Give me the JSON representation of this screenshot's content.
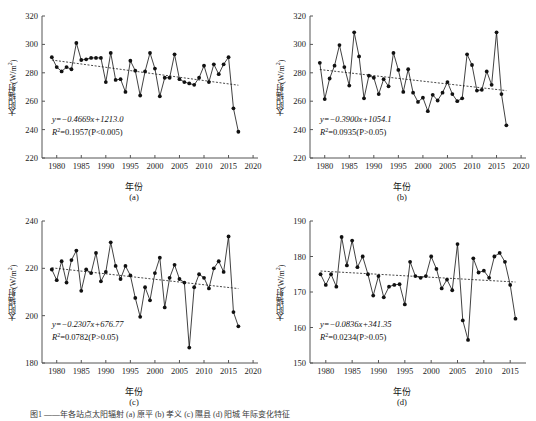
{
  "figure": {
    "axis_y_label": "太阳辐射(W/m",
    "axis_y_label_sup": "2",
    "axis_y_label_tail": ")",
    "axis_x_label": "年份",
    "caption_partial": "图1  ——年各站点太阳辐射 (a) 原平 (b) 孝义 (c) 隰县 (d) 阳城 年际变化特征"
  },
  "panels": [
    {
      "key": "a",
      "label": "(a)",
      "equation": "y=−0.4669x+1213.0",
      "r2_prefix": "R",
      "r2_sup": "2",
      "r2_text": "=0.1957(P<0.005)"
    },
    {
      "key": "b",
      "label": "(b)",
      "equation": "y=−0.3900x+1054.1",
      "r2_prefix": "R",
      "r2_sup": "2",
      "r2_text": "=0.0935(P>0.05)"
    },
    {
      "key": "c",
      "label": "(c)",
      "equation": "y=−0.2307x+676.77",
      "r2_prefix": "R",
      "r2_sup": "2",
      "r2_text": "=0.0782(P>0.05)"
    },
    {
      "key": "d",
      "label": "(d)",
      "equation": "y=−0.0836x+341.35",
      "r2_prefix": "R",
      "r2_sup": "2",
      "r2_text": "=0.0234(P>0.05)"
    }
  ],
  "chart_data": [
    {
      "panel": "a",
      "type": "line",
      "title": "(a)",
      "xlabel": "年份",
      "ylabel": "太阳辐射(W/m2)",
      "xlim": [
        1977,
        2021
      ],
      "ylim": [
        220,
        320
      ],
      "yticks": [
        220,
        240,
        260,
        280,
        300,
        320
      ],
      "xticks": [
        1980,
        1985,
        1990,
        1995,
        2000,
        2005,
        2010,
        2015,
        2020
      ],
      "grid": false,
      "legend": "none",
      "markers": "filled-circle",
      "trendline": {
        "style": "dotted",
        "slope": -0.4669,
        "intercept": 1213.0,
        "r2": 0.1957,
        "p": "<0.005"
      },
      "x": [
        1979,
        1980,
        1981,
        1982,
        1983,
        1984,
        1985,
        1986,
        1987,
        1988,
        1989,
        1990,
        1991,
        1992,
        1993,
        1994,
        1995,
        1996,
        1997,
        1998,
        1999,
        2000,
        2001,
        2002,
        2003,
        2004,
        2005,
        2006,
        2007,
        2008,
        2009,
        2010,
        2011,
        2012,
        2013,
        2014,
        2015,
        2016,
        2017
      ],
      "y": [
        291.0,
        284.0,
        281.0,
        284.0,
        282.5,
        301.0,
        289.0,
        289.5,
        290.5,
        290.5,
        290.5,
        273.5,
        294.0,
        275.0,
        275.5,
        266.5,
        288.5,
        281.5,
        264.0,
        281.0,
        294.0,
        283.0,
        263.5,
        276.5,
        276.5,
        293.0,
        275.5,
        273.5,
        272.5,
        271.5,
        276.5,
        285.0,
        273.5,
        286.0,
        279.0,
        286.0,
        291.0,
        255.0,
        238.5
      ]
    },
    {
      "panel": "b",
      "type": "line",
      "title": "(b)",
      "xlabel": "年份",
      "ylabel": "太阳辐射(W/m2)",
      "xlim": [
        1977,
        2021
      ],
      "ylim": [
        220,
        320
      ],
      "yticks": [
        220,
        240,
        260,
        280,
        300,
        320
      ],
      "xticks": [
        1980,
        1985,
        1990,
        1995,
        2000,
        2005,
        2010,
        2015,
        2020
      ],
      "grid": false,
      "legend": "none",
      "markers": "filled-circle",
      "trendline": {
        "style": "dotted",
        "slope": -0.39,
        "intercept": 1054.1,
        "r2": 0.0935,
        "p": ">0.05"
      },
      "x": [
        1979,
        1980,
        1981,
        1982,
        1983,
        1984,
        1985,
        1986,
        1987,
        1988,
        1989,
        1990,
        1991,
        1992,
        1993,
        1994,
        1995,
        1996,
        1997,
        1998,
        1999,
        2000,
        2001,
        2002,
        2003,
        2004,
        2005,
        2006,
        2007,
        2008,
        2009,
        2010,
        2011,
        2012,
        2013,
        2014,
        2015,
        2016,
        2017
      ],
      "y": [
        287.0,
        261.5,
        276.0,
        285.0,
        299.5,
        284.0,
        271.0,
        308.5,
        291.5,
        262.0,
        278.0,
        276.5,
        265.0,
        275.5,
        270.5,
        294.0,
        282.0,
        266.5,
        282.5,
        266.0,
        259.5,
        262.5,
        253.0,
        264.5,
        260.5,
        266.0,
        273.5,
        265.0,
        260.0,
        262.0,
        293.0,
        285.5,
        267.5,
        268.0,
        281.0,
        271.5,
        308.5,
        265.0,
        243.0
      ]
    },
    {
      "panel": "c",
      "type": "line",
      "title": "(c)",
      "xlabel": "年份",
      "ylabel": "太阳辐射(W/m2)",
      "xlim": [
        1977,
        2021
      ],
      "ylim": [
        180,
        240
      ],
      "yticks": [
        180,
        200,
        220,
        240
      ],
      "xticks": [
        1980,
        1985,
        1990,
        1995,
        2000,
        2005,
        2010,
        2015,
        2020
      ],
      "grid": false,
      "legend": "none",
      "markers": "filled-circle",
      "trendline": {
        "style": "dotted",
        "slope": -0.2307,
        "intercept": 676.77,
        "r2": 0.0782,
        "p": ">0.05"
      },
      "x": [
        1979,
        1980,
        1981,
        1982,
        1983,
        1984,
        1985,
        1986,
        1987,
        1988,
        1989,
        1990,
        1991,
        1992,
        1993,
        1994,
        1995,
        1996,
        1997,
        1998,
        1999,
        2000,
        2001,
        2002,
        2003,
        2004,
        2005,
        2006,
        2007,
        2008,
        2009,
        2010,
        2011,
        2012,
        2013,
        2014,
        2015,
        2016,
        2017
      ],
      "y": [
        219.5,
        215.0,
        223.0,
        214.0,
        223.5,
        227.5,
        210.5,
        219.5,
        218.0,
        226.5,
        214.5,
        218.5,
        231.0,
        221.0,
        215.5,
        221.0,
        217.0,
        207.5,
        199.5,
        212.0,
        206.5,
        218.0,
        224.5,
        203.5,
        216.0,
        221.5,
        215.5,
        214.0,
        186.5,
        212.0,
        217.5,
        216.0,
        211.5,
        220.0,
        223.0,
        218.5,
        233.5,
        201.5,
        195.5
      ]
    },
    {
      "panel": "d",
      "type": "line",
      "title": "(d)",
      "xlabel": "年份",
      "ylabel": "太阳辐射(W/m2)",
      "xlim": [
        1977,
        2018
      ],
      "ylim": [
        150,
        190
      ],
      "yticks": [
        150,
        160,
        170,
        180,
        190
      ],
      "xticks": [
        1980,
        1985,
        1990,
        1995,
        2000,
        2005,
        2010,
        2015
      ],
      "grid": false,
      "legend": "none",
      "markers": "filled-circle",
      "trendline": {
        "style": "dotted",
        "slope": -0.0836,
        "intercept": 341.35,
        "r2": 0.0234,
        "p": ">0.05"
      },
      "x": [
        1979,
        1980,
        1981,
        1982,
        1983,
        1984,
        1985,
        1986,
        1987,
        1988,
        1989,
        1990,
        1991,
        1992,
        1993,
        1994,
        1995,
        1996,
        1997,
        1998,
        1999,
        2000,
        2001,
        2002,
        2003,
        2004,
        2005,
        2006,
        2007,
        2008,
        2009,
        2010,
        2011,
        2012,
        2013,
        2014,
        2015,
        2016
      ],
      "y": [
        175.0,
        172.0,
        175.0,
        171.5,
        185.5,
        177.5,
        184.5,
        177.0,
        180.0,
        175.0,
        169.0,
        174.5,
        168.5,
        171.5,
        172.0,
        172.2,
        166.5,
        178.5,
        174.5,
        174.0,
        174.5,
        180.0,
        176.5,
        171.0,
        173.5,
        170.5,
        183.5,
        162.0,
        156.5,
        179.5,
        175.5,
        176.0,
        174.0,
        180.0,
        181.0,
        178.5,
        172.0,
        162.5
      ]
    }
  ]
}
